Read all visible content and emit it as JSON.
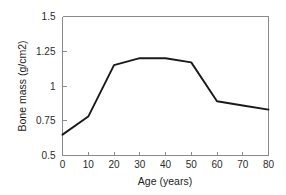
{
  "chart_data": {
    "type": "line",
    "title": "",
    "xlabel": "Age (years)",
    "ylabel": "Bone mass (g/cm2)",
    "x": [
      0,
      10,
      20,
      30,
      40,
      50,
      60,
      70,
      80
    ],
    "values": [
      0.65,
      0.78,
      1.15,
      1.2,
      1.2,
      1.17,
      0.89,
      0.86,
      0.83
    ],
    "series": [
      {
        "name": "Bone mass",
        "values": [
          0.65,
          0.78,
          1.15,
          1.2,
          1.2,
          1.17,
          0.89,
          0.86,
          0.83
        ]
      }
    ],
    "xlim": [
      0,
      80
    ],
    "ylim": [
      0.5,
      1.5
    ],
    "xticks": [
      0,
      10,
      20,
      30,
      40,
      50,
      60,
      70,
      80
    ],
    "yticks": [
      0.5,
      0.75,
      1,
      1.25,
      1.5
    ],
    "xtick_labels": [
      "0",
      "10",
      "20",
      "30",
      "40",
      "50",
      "60",
      "70",
      "80"
    ],
    "ytick_labels": [
      "0.5",
      "0.75",
      "1",
      "1.25",
      "1.5"
    ],
    "grid": false,
    "legend": false,
    "legend_position": "none",
    "line_color": "#1a1a1a",
    "axis_color": "#8a8a8a",
    "background_color": "#ffffff"
  }
}
